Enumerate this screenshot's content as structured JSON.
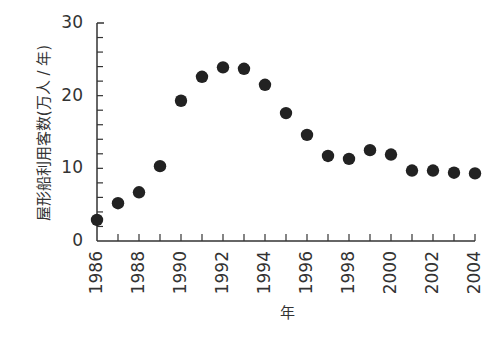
{
  "chart_data": {
    "type": "scatter",
    "title": "",
    "xlabel": "年",
    "ylabel": "屋形船利用客数(万人 / 年)",
    "x": [
      1986,
      1987,
      1988,
      1989,
      1990,
      1991,
      1992,
      1993,
      1994,
      1995,
      1996,
      1997,
      1998,
      1999,
      2000,
      2001,
      2002,
      2003,
      2004
    ],
    "series": [
      {
        "name": "屋形船利用客数",
        "values": [
          2.9,
          5.2,
          6.7,
          10.3,
          19.3,
          22.6,
          23.9,
          23.7,
          21.5,
          17.6,
          14.6,
          11.7,
          11.3,
          12.5,
          11.9,
          9.7,
          9.7,
          9.4,
          9.3
        ]
      }
    ],
    "xlim": [
      1986,
      2004
    ],
    "ylim": [
      0,
      30
    ],
    "x_tick_labels": [
      "1986",
      "1988",
      "1990",
      "1992",
      "1994",
      "1996",
      "1998",
      "2000",
      "2002",
      "2004"
    ],
    "y_tick_labels": [
      "0",
      "10",
      "20",
      "30"
    ],
    "y_minor_step": 2,
    "x_minor_step": 1,
    "grid": false,
    "legend": "none",
    "marker_color": "#222222"
  }
}
